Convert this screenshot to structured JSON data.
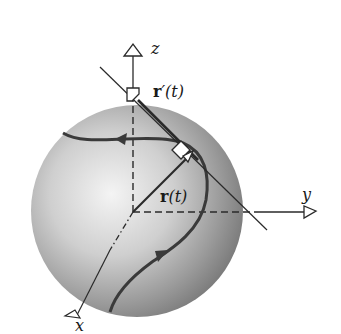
{
  "diagram": {
    "labels": {
      "z_axis": "z",
      "y_axis": "y",
      "x_axis": "x",
      "r_prime": "r′(t)",
      "r_prime_bold": "r",
      "r_prime_rest": "′(t)",
      "r": "r(t)",
      "r_bold": "r",
      "r_rest": "(t)"
    },
    "colors": {
      "sphere_light": "#f2f2f2",
      "sphere_mid": "#b8b8b8",
      "sphere_dark": "#6e6e6e",
      "curve": "#3a3a3a",
      "axis": "#2a2a2a",
      "background": "#ffffff"
    },
    "elements": [
      "sphere",
      "z-axis (dashed inside sphere, solid above, open arrowhead)",
      "y-axis (dashed inside sphere, solid outside, open arrowhead)",
      "x-axis (dash-dot inside sphere, open arrowhead)",
      "curve on sphere with two direction arrowheads",
      "position vector r(t) from origin to curve point",
      "tangent line through curve point",
      "vector r'(t) translated to origin top, along tangent",
      "right-angle marker between r(t) and r'(t)"
    ]
  }
}
